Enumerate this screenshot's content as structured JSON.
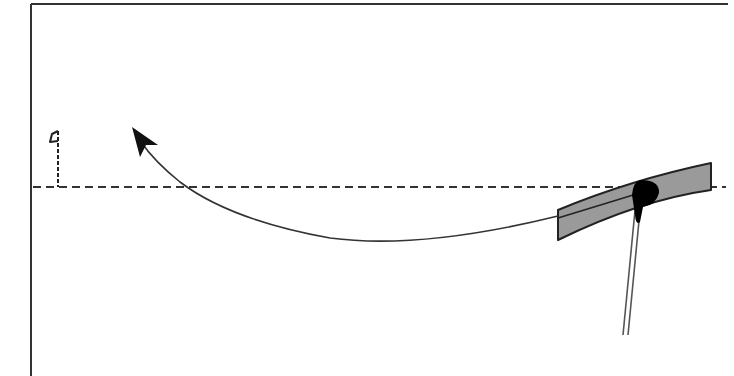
{
  "diagram": {
    "frame": {
      "left": 31,
      "top": 4,
      "right": 728,
      "stroke": "#333333"
    },
    "target_line": {
      "y": 187,
      "x1": 33,
      "x2": 726,
      "style": "dashed",
      "stroke": "#333333"
    },
    "flag": {
      "label": "hole-flag",
      "x": 58,
      "top": 129,
      "bottom": 187
    },
    "ball_path": {
      "label": "curved-ball-path",
      "start": [
        650,
        193
      ],
      "end": [
        134,
        128
      ],
      "stroke": "#333333",
      "arrowhead": "open-triangle-at-end"
    },
    "putter_face": {
      "label": "putter-face",
      "fill": "#999999",
      "stroke": "#222222"
    },
    "ball": {
      "label": "golf-ball",
      "fill": "#000000"
    },
    "shaft": {
      "label": "putter-shaft",
      "stroke": "#555555"
    }
  }
}
